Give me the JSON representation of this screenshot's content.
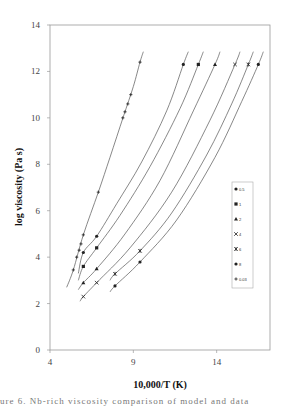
{
  "chart_data": {
    "type": "line",
    "title": "",
    "xlabel": "10,000/T (K)",
    "ylabel": "log viscosity (Pa s)",
    "xlim": [
      4,
      17.2
    ],
    "ylim": [
      0,
      14
    ],
    "xticks": [
      4,
      9,
      14
    ],
    "yticks": [
      0,
      2,
      4,
      6,
      8,
      10,
      12,
      14
    ],
    "grid": false,
    "legend_position": "right",
    "series": [
      {
        "name": "0.5",
        "marker": "dot",
        "points": [
          [
            6.0,
            4.2
          ],
          [
            6.8,
            4.9
          ],
          [
            12.0,
            12.3
          ]
        ],
        "curve": [
          [
            5.7,
            3.3
          ],
          [
            6.0,
            4.2
          ],
          [
            6.8,
            4.9
          ],
          [
            8.0,
            6.3
          ],
          [
            9.5,
            8.1
          ],
          [
            11.0,
            10.3
          ],
          [
            12.0,
            12.3
          ],
          [
            12.3,
            12.85
          ]
        ]
      },
      {
        "name": "1",
        "marker": "square",
        "points": [
          [
            6.0,
            3.6
          ],
          [
            6.8,
            4.4
          ],
          [
            12.9,
            12.3
          ]
        ],
        "curve": [
          [
            5.7,
            3.0
          ],
          [
            6.0,
            3.6
          ],
          [
            6.8,
            4.4
          ],
          [
            8.2,
            5.8
          ],
          [
            10.0,
            7.9
          ],
          [
            11.8,
            10.4
          ],
          [
            12.9,
            12.3
          ],
          [
            13.2,
            12.85
          ]
        ]
      },
      {
        "name": "2",
        "marker": "triangle",
        "points": [
          [
            6.0,
            2.9
          ],
          [
            6.8,
            3.5
          ],
          [
            13.9,
            12.3
          ]
        ],
        "curve": [
          [
            5.7,
            2.6
          ],
          [
            6.0,
            2.9
          ],
          [
            6.8,
            3.5
          ],
          [
            8.5,
            5.0
          ],
          [
            10.6,
            7.3
          ],
          [
            12.6,
            10.3
          ],
          [
            13.9,
            12.3
          ],
          [
            14.2,
            12.85
          ]
        ]
      },
      {
        "name": "4",
        "marker": "x",
        "points": [
          [
            6.0,
            2.3
          ],
          [
            6.8,
            2.9
          ],
          [
            15.1,
            12.3
          ]
        ],
        "curve": [
          [
            5.8,
            2.1
          ],
          [
            6.0,
            2.3
          ],
          [
            6.8,
            2.9
          ],
          [
            8.8,
            4.4
          ],
          [
            11.3,
            6.8
          ],
          [
            13.6,
            9.9
          ],
          [
            15.1,
            12.3
          ],
          [
            15.4,
            12.85
          ]
        ]
      },
      {
        "name": "6",
        "marker": "star",
        "points": [
          [
            7.9,
            3.28
          ],
          [
            9.4,
            4.27
          ],
          [
            15.9,
            12.3
          ]
        ],
        "curve": [
          [
            7.6,
            3.0
          ],
          [
            7.9,
            3.28
          ],
          [
            9.4,
            4.27
          ],
          [
            11.3,
            5.9
          ],
          [
            13.4,
            8.4
          ],
          [
            14.9,
            10.6
          ],
          [
            15.9,
            12.3
          ],
          [
            16.2,
            12.85
          ]
        ]
      },
      {
        "name": "8",
        "marker": "dot",
        "points": [
          [
            7.9,
            2.76
          ],
          [
            9.4,
            3.79
          ],
          [
            16.5,
            12.3
          ]
        ],
        "curve": [
          [
            7.6,
            2.5
          ],
          [
            7.9,
            2.76
          ],
          [
            9.4,
            3.79
          ],
          [
            11.6,
            5.6
          ],
          [
            13.9,
            8.3
          ],
          [
            15.5,
            10.7
          ],
          [
            16.5,
            12.3
          ],
          [
            16.8,
            12.85
          ]
        ]
      },
      {
        "name": "0.03",
        "marker": "plus",
        "points": [
          [
            5.4,
            3.45
          ],
          [
            5.6,
            4.0
          ],
          [
            5.75,
            4.3
          ],
          [
            5.86,
            4.57
          ],
          [
            6.0,
            4.96
          ],
          [
            6.9,
            6.8
          ],
          [
            8.37,
            10.0
          ],
          [
            8.5,
            10.26
          ],
          [
            8.67,
            10.6
          ],
          [
            8.85,
            11.0
          ],
          [
            9.4,
            12.4
          ]
        ],
        "curve": [
          [
            5.0,
            2.7
          ],
          [
            5.4,
            3.45
          ],
          [
            6.0,
            4.96
          ],
          [
            6.9,
            6.8
          ],
          [
            7.6,
            8.3
          ],
          [
            8.4,
            10.05
          ],
          [
            9.0,
            11.35
          ],
          [
            9.4,
            12.4
          ],
          [
            9.6,
            12.85
          ]
        ]
      }
    ]
  },
  "caption": "ure 6. Nb-rich viscosity comparison of model and data"
}
